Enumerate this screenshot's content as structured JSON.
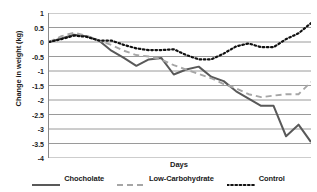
{
  "chart_data": {
    "type": "line",
    "title": "",
    "xlabel": "Days",
    "ylabel": "Change in weight (kg)",
    "ylim": [
      -4,
      1
    ],
    "yticks": [
      1,
      0.5,
      0,
      -0.5,
      -1,
      -1.5,
      -2,
      -2.5,
      -3,
      -3.5,
      -4
    ],
    "ytick_labels": [
      "1",
      "0.5",
      "0",
      "-0.5",
      "-1",
      "-1.5",
      "-2",
      "-2.5",
      "-3",
      "-3.5",
      "-4"
    ],
    "xlim": [
      0,
      21
    ],
    "xticks_visible": false,
    "grid": "horizontal",
    "legend_position": "bottom",
    "x": [
      0,
      1,
      2,
      3,
      4,
      5,
      6,
      7,
      8,
      9,
      10,
      11,
      12,
      13,
      14,
      15,
      16,
      17,
      18,
      19,
      20,
      21
    ],
    "series": [
      {
        "name": "Chocholate",
        "color": "#595959",
        "style": "solid",
        "values": [
          0.0,
          0.12,
          0.25,
          0.2,
          0.05,
          -0.3,
          -0.55,
          -0.82,
          -0.6,
          -0.55,
          -1.12,
          -0.95,
          -0.85,
          -1.2,
          -1.35,
          -1.7,
          -1.95,
          -2.2,
          -2.2,
          -3.25,
          -2.85,
          -3.45
        ]
      },
      {
        "name": "Low-Carbohydrate",
        "color": "#a6a6a6",
        "style": "dashed",
        "values": [
          0.0,
          0.2,
          0.32,
          0.22,
          0.05,
          -0.1,
          -0.3,
          -0.45,
          -0.5,
          -0.6,
          -0.8,
          -0.95,
          -1.1,
          -1.25,
          -1.45,
          -1.6,
          -1.8,
          -1.9,
          -1.85,
          -1.8,
          -1.8,
          -1.38
        ]
      },
      {
        "name": "Control",
        "color": "#111111",
        "style": "dotted",
        "values": [
          0.0,
          0.1,
          0.22,
          0.18,
          0.05,
          0.05,
          -0.1,
          -0.22,
          -0.28,
          -0.28,
          -0.25,
          -0.45,
          -0.6,
          -0.6,
          -0.4,
          -0.15,
          -0.05,
          -0.18,
          -0.18,
          0.1,
          0.3,
          0.65
        ]
      }
    ]
  },
  "legend": {
    "items": [
      {
        "label": "Chocholate",
        "color": "#595959",
        "style": "solid"
      },
      {
        "label": "Low-Carbohydrate",
        "color": "#a6a6a6",
        "style": "dashed"
      },
      {
        "label": "Control",
        "color": "#111111",
        "style": "dotted"
      }
    ]
  }
}
